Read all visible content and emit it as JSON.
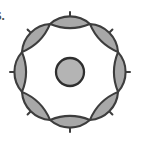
{
  "canvas": {
    "width": 141,
    "height": 148,
    "background": "#ffffff"
  },
  "figure": {
    "label": "6.",
    "label_color": "#4a4a4a",
    "name": "eight-petal-rosette"
  },
  "geometry": {
    "center_x": 70,
    "center_y": 72,
    "petal_count": 8,
    "petal_ring_outer_radius": 52,
    "petal_ring_inner_radius": 30,
    "spike_outer_radius": 60,
    "hub_radius": 14,
    "spike_count": 8,
    "spike_angles_deg": [
      0,
      45,
      90,
      135,
      180,
      225,
      270,
      315
    ]
  },
  "colors": {
    "petal_fill": "#a8a8a8",
    "petal_stroke": "#3d3d3d",
    "hub_fill": "#b4b4b4",
    "hub_stroke": "#2e2e2e",
    "spike_stroke": "#3d3d3d",
    "interior_fill": "#ffffff",
    "background": "#ffffff"
  },
  "strokes": {
    "petal_width": 2.1,
    "hub_width": 2.3,
    "spike_width": 2.0
  }
}
